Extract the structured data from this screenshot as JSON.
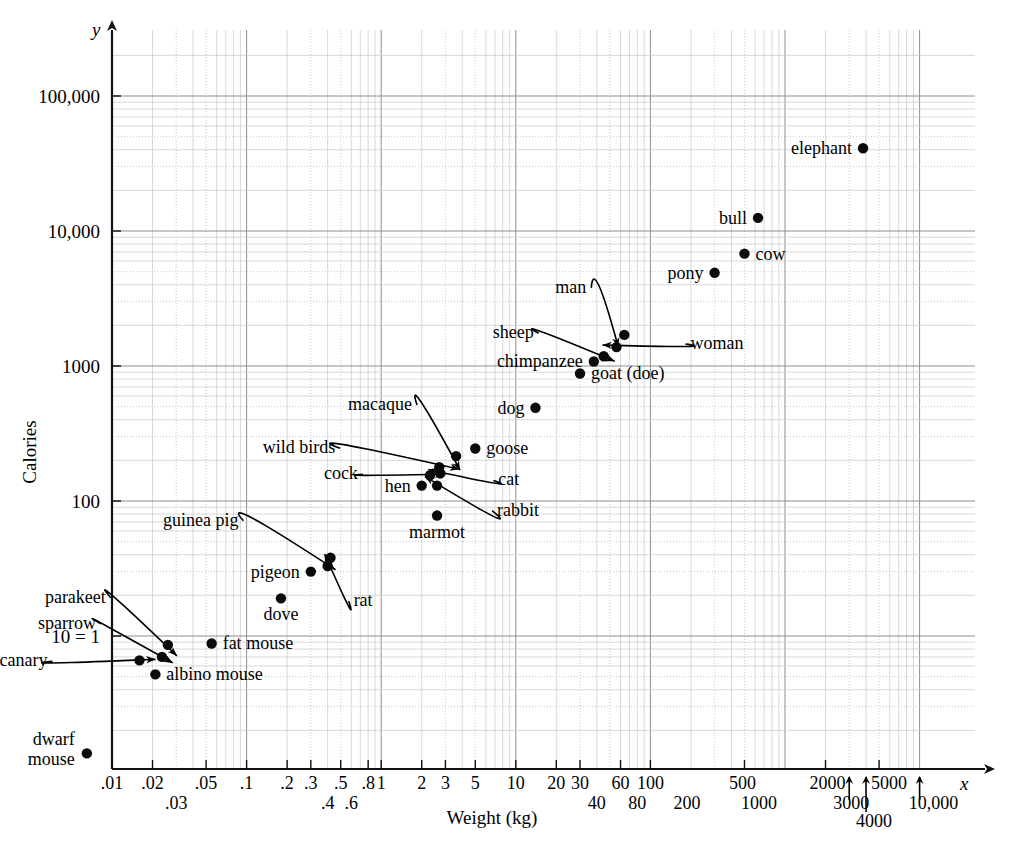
{
  "chart_data": {
    "type": "scatter",
    "title": "",
    "xlabel": "Weight (kg)",
    "ylabel": "Calories",
    "x_axis_var": "x",
    "y_axis_var": "y",
    "xscale": "log",
    "yscale": "log",
    "xlim": [
      0.01,
      10000
    ],
    "ylim": [
      1,
      200000
    ],
    "grid": true,
    "legend": "none",
    "x_tick_labels": [
      ".01",
      ".02",
      ".03",
      ".05",
      ".1",
      ".2",
      ".3",
      ".4",
      ".5",
      ".6",
      ".8",
      "1",
      "2",
      "3",
      "5",
      "10",
      "20",
      "30",
      "40",
      "60",
      "80",
      "100",
      "200",
      "500",
      "1000",
      "2000",
      "3000",
      "4000",
      "5000",
      "10,000"
    ],
    "y_tick_labels": [
      "10 = 1",
      "100",
      "1000",
      "10,000",
      "100,000"
    ],
    "y_tick_values": [
      10,
      100,
      1000,
      10000,
      100000
    ],
    "points": [
      {
        "label": "dwarf mouse",
        "x": 0.0065,
        "y": 1.35,
        "label_pos": "left",
        "leader": false
      },
      {
        "label": "canary",
        "x": 0.016,
        "y": 6.6,
        "label_pos": "left",
        "leader": true
      },
      {
        "label": "albino mouse",
        "x": 0.021,
        "y": 5.2,
        "label_pos": "right",
        "leader": false
      },
      {
        "label": "sparrow",
        "x": 0.0235,
        "y": 7.0,
        "label_pos": "left",
        "leader": true
      },
      {
        "label": "parakeet",
        "x": 0.026,
        "y": 8.6,
        "label_pos": "left",
        "leader": true
      },
      {
        "label": "fat mouse",
        "x": 0.055,
        "y": 8.8,
        "label_pos": "right",
        "leader": false
      },
      {
        "label": "dove",
        "x": 0.18,
        "y": 19,
        "label_pos": "below",
        "leader": false
      },
      {
        "label": "pigeon",
        "x": 0.3,
        "y": 30,
        "label_pos": "left",
        "leader": false
      },
      {
        "label": "rat",
        "x": 0.4,
        "y": 33,
        "label_pos": "below",
        "leader": true
      },
      {
        "label": "guinea pig",
        "x": 0.42,
        "y": 38,
        "label_pos": "above",
        "leader": true
      },
      {
        "label": "marmot",
        "x": 2.6,
        "y": 78,
        "label_pos": "below",
        "leader": false
      },
      {
        "label": "hen",
        "x": 2.0,
        "y": 130,
        "label_pos": "left",
        "leader": false
      },
      {
        "label": "rabbit",
        "x": 2.6,
        "y": 130,
        "label_pos": "right",
        "leader": true
      },
      {
        "label": "cock",
        "x": 2.3,
        "y": 155,
        "label_pos": "left",
        "leader": true
      },
      {
        "label": "wild birds",
        "x": 2.7,
        "y": 178,
        "label_pos": "left",
        "leader": true
      },
      {
        "label": "cat",
        "x": 2.75,
        "y": 160,
        "label_pos": "right",
        "leader": true
      },
      {
        "label": "macaque",
        "x": 3.6,
        "y": 215,
        "label_pos": "above",
        "leader": true
      },
      {
        "label": "goose",
        "x": 5.0,
        "y": 245,
        "label_pos": "right",
        "leader": false
      },
      {
        "label": "dog",
        "x": 14,
        "y": 490,
        "label_pos": "left",
        "leader": false
      },
      {
        "label": "goat (doe)",
        "x": 30,
        "y": 880,
        "label_pos": "right",
        "leader": false
      },
      {
        "label": "chimpanzee",
        "x": 38,
        "y": 1080,
        "label_pos": "left",
        "leader": false
      },
      {
        "label": "sheep",
        "x": 45,
        "y": 1180,
        "label_pos": "left",
        "leader": true
      },
      {
        "label": "woman",
        "x": 56,
        "y": 1380,
        "label_pos": "right",
        "leader": true
      },
      {
        "label": "man",
        "x": 64,
        "y": 1700,
        "label_pos": "above",
        "leader": true
      },
      {
        "label": "pony",
        "x": 300,
        "y": 4900,
        "label_pos": "left",
        "leader": false
      },
      {
        "label": "cow",
        "x": 500,
        "y": 6800,
        "label_pos": "right",
        "leader": false
      },
      {
        "label": "bull",
        "x": 630,
        "y": 12500,
        "label_pos": "left",
        "leader": false
      },
      {
        "label": "elephant",
        "x": 3800,
        "y": 41000,
        "label_pos": "left",
        "leader": false
      }
    ],
    "arrow_ticks": [
      {
        "label": "3000",
        "value": 3000
      },
      {
        "label": "4000",
        "value": 4000
      },
      {
        "label": "10,000",
        "value": 10000
      }
    ]
  }
}
